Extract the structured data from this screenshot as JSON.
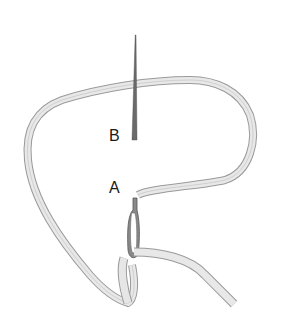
{
  "figure": {
    "labels": {
      "a": "A",
      "b": "B"
    },
    "colors": {
      "ribbon_fill": "#e6e6e6",
      "ribbon_edge": "#9a9a9a",
      "needle": "#6a6a6a",
      "loop": "#7a7a7a",
      "text": "#1a1a1a",
      "background": "#ffffff"
    }
  }
}
